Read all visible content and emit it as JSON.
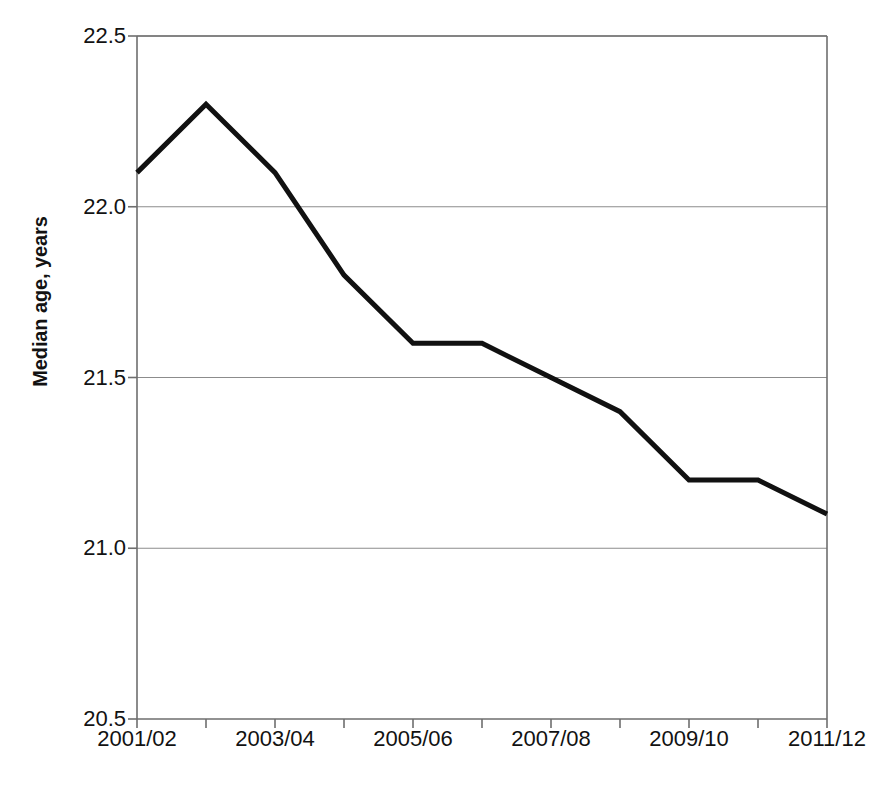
{
  "chart_data": {
    "type": "line",
    "title": "",
    "subtitle": "",
    "xlabel": "",
    "ylabel": "Median age, years",
    "x": [
      "2001/02",
      "2002/03",
      "2003/04",
      "2004/05",
      "2005/06",
      "2006/07",
      "2007/08",
      "2008/09",
      "2009/10",
      "2010/11",
      "2011/12"
    ],
    "categories": [
      "2001/02",
      "2002/03",
      "2003/04",
      "2004/05",
      "2005/06",
      "2006/07",
      "2007/08",
      "2008/09",
      "2009/10",
      "2010/11",
      "2011/12"
    ],
    "values": [
      22.1,
      22.3,
      22.1,
      21.8,
      21.6,
      21.6,
      21.5,
      21.4,
      21.2,
      21.2,
      21.1
    ],
    "series": [
      {
        "name": "Median age",
        "values": [
          22.1,
          22.3,
          22.1,
          21.8,
          21.6,
          21.6,
          21.5,
          21.4,
          21.2,
          21.2,
          21.1
        ],
        "color": "#111111"
      }
    ],
    "ylim": [
      20.5,
      22.5
    ],
    "xlim": [
      0,
      10
    ],
    "y_ticks": [
      20.5,
      21.0,
      21.5,
      22.0,
      22.5
    ],
    "y_tick_labels": [
      "20.5",
      "21.0",
      "21.5",
      "22.0",
      "22.5"
    ],
    "x_tick_labels_shown": [
      "2001/02",
      "2003/04",
      "2005/06",
      "2007/08",
      "2009/10",
      "2011/12"
    ],
    "x_tick_label_indices": [
      0,
      2,
      4,
      6,
      8,
      10
    ],
    "grid": "horizontal",
    "legend": "none",
    "annotations": []
  },
  "style": {
    "background": "#ffffff",
    "line_color": "#111111",
    "grid_color": "#8c8c8c",
    "axis_color": "#6e6e6e",
    "text_color": "#121212",
    "line_width_px": 5
  }
}
